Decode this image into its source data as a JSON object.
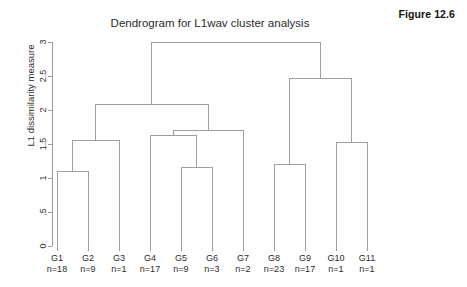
{
  "figure": {
    "label": "Figure 12.6"
  },
  "chart_data": {
    "type": "dendrogram",
    "title": "Dendrogram for L1wav cluster analysis",
    "xlabel": "",
    "ylabel": "L1 dissimilarity measure",
    "ylim": [
      0,
      3
    ],
    "yticks": [
      0,
      0.5,
      1,
      1.5,
      2,
      2.5,
      3
    ],
    "ytick_labels": [
      "0",
      ".5",
      "1",
      "1.5",
      "2",
      "2.5",
      "3"
    ],
    "grid": false,
    "legend": "none",
    "leaves": [
      {
        "id": "G1",
        "label": "G1",
        "count_label": "n=18",
        "n": 18
      },
      {
        "id": "G2",
        "label": "G2",
        "count_label": "n=9",
        "n": 9
      },
      {
        "id": "G3",
        "label": "G3",
        "count_label": "n=1",
        "n": 1
      },
      {
        "id": "G4",
        "label": "G4",
        "count_label": "n=17",
        "n": 17
      },
      {
        "id": "G5",
        "label": "G5",
        "count_label": "n=9",
        "n": 9
      },
      {
        "id": "G6",
        "label": "G6",
        "count_label": "n=3",
        "n": 3
      },
      {
        "id": "G7",
        "label": "G7",
        "count_label": "n=2",
        "n": 2
      },
      {
        "id": "G8",
        "label": "G8",
        "count_label": "n=23",
        "n": 23
      },
      {
        "id": "G9",
        "label": "G9",
        "count_label": "n=17",
        "n": 17
      },
      {
        "id": "G10",
        "label": "G10",
        "count_label": "n=1",
        "n": 1
      },
      {
        "id": "G11",
        "label": "G11",
        "count_label": "n=1",
        "n": 1
      }
    ],
    "merges": [
      {
        "id": "m1",
        "left": "G1",
        "right": "G2",
        "height": 1.1
      },
      {
        "id": "m2",
        "left": "m1",
        "right": "G3",
        "height": 1.55
      },
      {
        "id": "m3",
        "left": "G5",
        "right": "G6",
        "height": 1.15
      },
      {
        "id": "m4",
        "left": "G4",
        "right": "m3",
        "height": 1.63
      },
      {
        "id": "m5",
        "left": "m4",
        "right": "G7",
        "height": 1.7
      },
      {
        "id": "m6",
        "left": "m2",
        "right": "m5",
        "height": 2.08
      },
      {
        "id": "m7",
        "left": "G8",
        "right": "G9",
        "height": 1.2
      },
      {
        "id": "m8",
        "left": "G10",
        "right": "G11",
        "height": 1.52
      },
      {
        "id": "m9",
        "left": "m7",
        "right": "m8",
        "height": 2.47
      },
      {
        "id": "m10",
        "left": "m6",
        "right": "m9",
        "height": 3.0
      }
    ],
    "colors": {
      "line": "#a0a0a0",
      "axis": "#9a9a9a",
      "text": "#2b2b2b",
      "background": "#ffffff"
    }
  }
}
